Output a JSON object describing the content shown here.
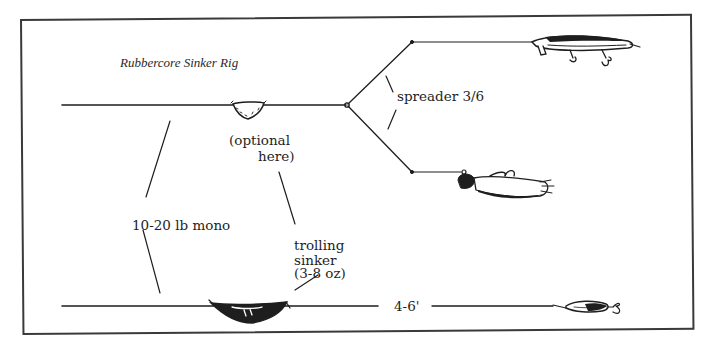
{
  "diagram": {
    "title": "Rubbercore Sinker Rig",
    "labels": {
      "spreader": "spreader 3/6",
      "optional_line1": "(optional",
      "optional_line2": "here)",
      "mono": "10-20 lb mono",
      "trolling_line1": "trolling",
      "trolling_line2": "sinker",
      "trolling_line3": "(3-8 oz)",
      "leader_length": "4-6'"
    },
    "components": [
      {
        "id": "main-line-top",
        "type": "line"
      },
      {
        "id": "rubbercore-sinker-optional",
        "type": "sinker"
      },
      {
        "id": "spreader",
        "type": "spreader-arms"
      },
      {
        "id": "minnow-plug-lure",
        "type": "lure"
      },
      {
        "id": "bucktail-jig-lure",
        "type": "lure"
      },
      {
        "id": "main-line-bottom",
        "type": "line"
      },
      {
        "id": "trolling-sinker",
        "type": "sinker"
      },
      {
        "id": "spoon-lure",
        "type": "lure"
      }
    ],
    "colors": {
      "ink": "#1e1e1e",
      "frame": "#3a3a3a",
      "background": "#ffffff"
    }
  }
}
